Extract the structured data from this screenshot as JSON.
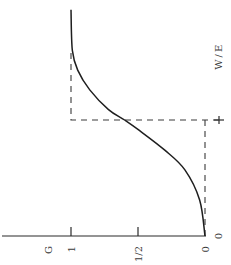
{
  "chart_data": {
    "type": "line",
    "orientation": "rotated-90-clockwise",
    "title": "",
    "xlabel": "W/E",
    "ylabel": "G",
    "xlim": [
      0,
      1.95
    ],
    "ylim": [
      0,
      1
    ],
    "x_ticks": [
      {
        "value": 0,
        "label": "0"
      },
      {
        "value": 1,
        "label": ""
      }
    ],
    "y_ticks": [
      {
        "value": 0,
        "label": "0"
      },
      {
        "value": 0.5,
        "label": "1/2"
      },
      {
        "value": 1,
        "label": "1"
      }
    ],
    "grid": false,
    "series": [
      {
        "name": "smooth",
        "style": "solid",
        "x": [
          0,
          0.31,
          0.57,
          0.74,
          0.91,
          1.0,
          1.09,
          1.26,
          1.43,
          1.6,
          1.95
        ],
        "y": [
          0,
          0.04,
          0.15,
          0.3,
          0.49,
          0.6,
          0.72,
          0.86,
          0.95,
          0.99,
          1.0
        ]
      },
      {
        "name": "step",
        "style": "dashed",
        "x": [
          0,
          1,
          1,
          1.6
        ],
        "y": [
          0,
          0,
          1,
          1
        ]
      }
    ],
    "step_extension": {
      "x": 1,
      "y_from": 0,
      "y_to": 0,
      "note": "dashed step horizontal extends past axis to the W/E=1 tick"
    }
  }
}
